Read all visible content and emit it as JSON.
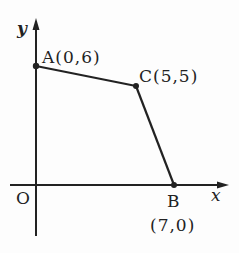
{
  "diagram": {
    "type": "coordinate-plane-polygon",
    "axes": {
      "x_label": "x",
      "y_label": "y",
      "origin_label": "O"
    },
    "points": [
      {
        "name": "A",
        "coords": "(0,6)",
        "label": "A(0,6)",
        "x": 0,
        "y": 6
      },
      {
        "name": "C",
        "coords": "(5,5)",
        "label": "C(5,5)",
        "x": 5,
        "y": 5
      },
      {
        "name": "B",
        "coords": "(7,0)",
        "label_name": "B",
        "label_coords": "(7,0)",
        "x": 7,
        "y": 0
      }
    ],
    "segments": [
      [
        "A",
        "C"
      ],
      [
        "C",
        "B"
      ]
    ],
    "colors": {
      "stroke": "#222222",
      "background": "#fdfdfd"
    }
  }
}
